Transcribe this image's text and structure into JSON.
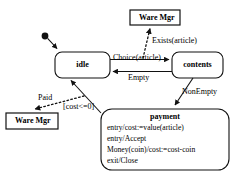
{
  "diagram": {
    "stroke_color": "#111111",
    "fill_color": "#ffffff",
    "initial_marker": "initial-state-dot"
  },
  "states": [
    {
      "id": "idle",
      "label": "idle"
    },
    {
      "id": "contents",
      "label": "contents"
    },
    {
      "id": "payment",
      "label": "payment",
      "actions": [
        "entry/cost:=value(article)",
        "entry/Accept",
        "Money(coin)/cost:=cost-coin",
        "exit/Close"
      ]
    }
  ],
  "actors": [
    {
      "id": "ware-mgr-top",
      "label": "Ware Mgr"
    },
    {
      "id": "ware-mgr-bottom",
      "label": "Ware Mgr"
    }
  ],
  "transitions": [
    {
      "id": "choice",
      "label": "Choice(article)",
      "from": "idle",
      "to": "contents",
      "style": "solid"
    },
    {
      "id": "empty",
      "label": "Empty",
      "from": "contents",
      "to": "idle",
      "style": "solid"
    },
    {
      "id": "nonempty",
      "label": "NonEmpty",
      "from": "contents",
      "to": "payment",
      "style": "solid"
    },
    {
      "id": "guard",
      "label": "[cost<=0]",
      "from": "payment",
      "to": "idle",
      "style": "solid"
    },
    {
      "id": "exists",
      "label": "Exists(article)",
      "from": "choice-transition",
      "to": "ware-mgr-top",
      "style": "dashed"
    },
    {
      "id": "paid",
      "label": "Paid",
      "from": "guard-transition",
      "to": "ware-mgr-bottom",
      "style": "dashed"
    }
  ]
}
